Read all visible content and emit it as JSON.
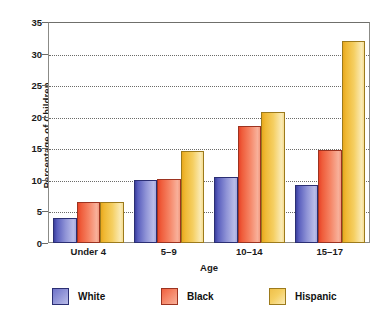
{
  "chart_data": {
    "type": "bar",
    "title": "",
    "subtitle": "",
    "xlabel": "Age",
    "ylabel": "Percentage of Children",
    "categories": [
      "Under 4",
      "5–9",
      "10–14",
      "15–17"
    ],
    "series": [
      {
        "name": "White",
        "color": "#8f93d6",
        "values": [
          4.0,
          10.0,
          10.5,
          9.2
        ]
      },
      {
        "name": "Black",
        "color": "#f58566",
        "values": [
          6.5,
          10.1,
          18.6,
          14.7
        ]
      },
      {
        "name": "Hispanic",
        "color": "#f5cf62",
        "values": [
          6.5,
          14.5,
          20.7,
          32.0
        ]
      }
    ],
    "ylim": [
      0,
      35
    ],
    "ytick_step": 5,
    "yticks": [
      "0",
      "5",
      "10",
      "15",
      "20",
      "25",
      "30",
      "35"
    ],
    "grid": true,
    "grid_axis": "y",
    "grid_style": "dotted",
    "legend_position": "bottom",
    "legend": [
      "White",
      "Black",
      "Hispanic"
    ],
    "plot_border": true,
    "background": "#ffffff",
    "text_color": "#1a1a1a"
  },
  "axis": {
    "y_title": "Percentage of Children",
    "x_title": "Age"
  }
}
